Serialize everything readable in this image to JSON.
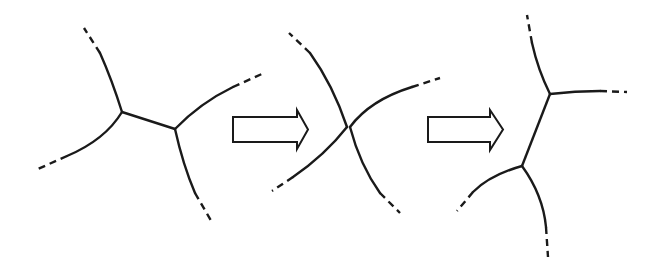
{
  "diagram": {
    "title": "",
    "stroke_color": "#1a1a1a",
    "background": "#ffffff",
    "stages": [
      {
        "name": "initial",
        "vertices": [
          [
            122,
            112
          ],
          [
            175,
            129
          ]
        ],
        "edges": [
          {
            "solid": "M122,112 Q112,80 100,53",
            "dashed": "M100,53 L84,28"
          },
          {
            "solid": "M122,112 Q105,140 67,156",
            "dashed": "M67,156 L38,169"
          },
          {
            "solid": "M122,112 L175,129",
            "dashed": ""
          },
          {
            "solid": "M175,129 Q200,103 233,87",
            "dashed": "M233,87 L264,73"
          },
          {
            "solid": "M175,129 Q183,165 195,193",
            "dashed": "M195,193 L213,224"
          }
        ]
      },
      {
        "name": "four-fold-vertex",
        "vertices": [
          [
            347,
            127
          ]
        ],
        "edges": [
          {
            "solid": "M347,127 Q333,85 310,53",
            "dashed": "M310,53 L289,33"
          },
          {
            "solid": "M347,127 Q325,155 293,177",
            "dashed": "M293,177 L272,191"
          },
          {
            "solid": "M350,127 Q370,100 412,87",
            "dashed": "M412,87 L440,78"
          },
          {
            "solid": "M350,127 Q360,165 380,193",
            "dashed": "M380,193 L400,213"
          }
        ]
      },
      {
        "name": "final",
        "vertices": [
          [
            550,
            94
          ],
          [
            522,
            166
          ]
        ],
        "edges": [
          {
            "solid": "M550,94 Q538,70 532,43",
            "dashed": "M532,43 L527,15"
          },
          {
            "solid": "M550,94 Q575,91 600,91",
            "dashed": "M600,91 L627,92"
          },
          {
            "solid": "M550,94 L522,166",
            "dashed": ""
          },
          {
            "solid": "M522,166 Q490,175 473,192",
            "dashed": "M473,192 L457,211"
          },
          {
            "solid": "M522,166 Q543,195 546,227",
            "dashed": "M546,227 L548,257"
          }
        ]
      }
    ],
    "arrows": [
      {
        "name": "transition-arrow-1",
        "points": "233,117 297,117 297,110 308,129.5 297,149 297,142 233,142"
      },
      {
        "name": "transition-arrow-2",
        "points": "428,117 490,117 490,110 503,129.5 490,150 490,142 428,142"
      }
    ]
  }
}
